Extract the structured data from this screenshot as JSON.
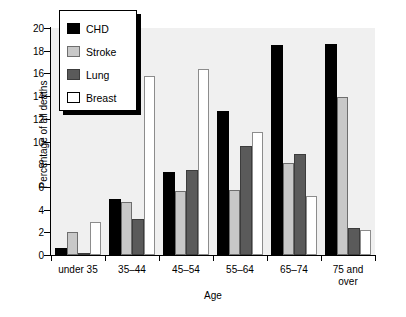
{
  "chart_data": {
    "type": "bar",
    "title": "",
    "xlabel": "Age",
    "ylabel": "Percentage of all deaths",
    "ylim": [
      0,
      20
    ],
    "ytick_step": 2,
    "yticks": [
      0,
      2,
      4,
      6,
      8,
      10,
      12,
      14,
      16,
      18,
      20
    ],
    "grid": false,
    "legend_position": "top-left",
    "categories": [
      "under 35",
      "35–44",
      "45–54",
      "55–64",
      "65–74",
      "75 and\nover"
    ],
    "series": [
      {
        "name": "CHD",
        "color": "#000000",
        "values": [
          0.6,
          4.9,
          7.3,
          12.7,
          18.5,
          18.6
        ]
      },
      {
        "name": "Stroke",
        "color": "#c8c8c8",
        "values": [
          2.0,
          4.7,
          5.6,
          5.7,
          8.1,
          13.9
        ]
      },
      {
        "name": "Lung",
        "color": "#5a5a5a",
        "values": [
          0.2,
          3.2,
          7.5,
          9.6,
          8.9,
          2.4
        ]
      },
      {
        "name": "Breast",
        "color": "#ffffff",
        "values": [
          2.9,
          15.8,
          16.4,
          10.8,
          5.2,
          2.2
        ]
      }
    ]
  },
  "legend": {
    "items": [
      {
        "label": "CHD",
        "key": "chd"
      },
      {
        "label": "Stroke",
        "key": "stroke"
      },
      {
        "label": "Lung",
        "key": "lung"
      },
      {
        "label": "Breast",
        "key": "breast"
      }
    ]
  }
}
